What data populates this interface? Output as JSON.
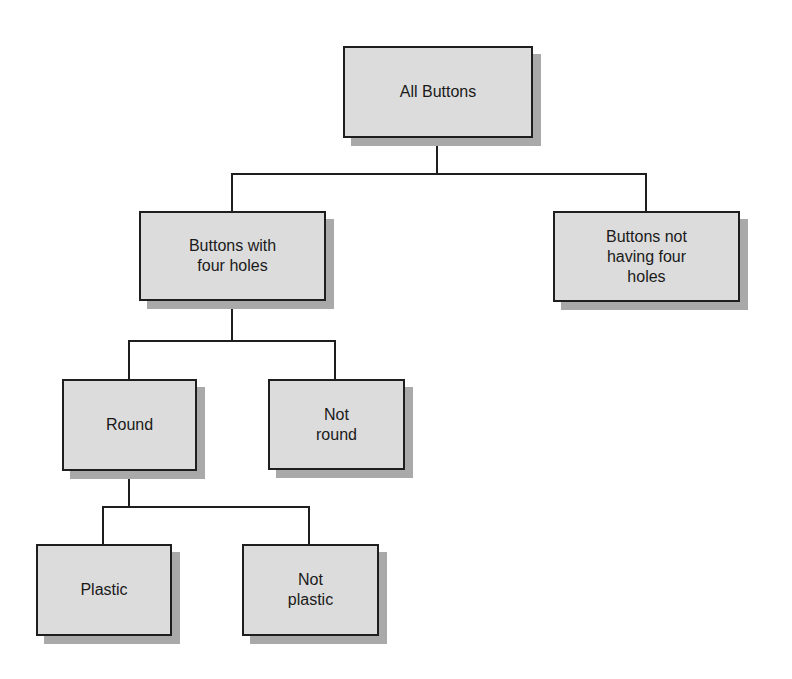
{
  "diagram": {
    "type": "tree",
    "nodes": {
      "root": {
        "label": "All Buttons"
      },
      "four_holes": {
        "label": "Buttons with\nfour holes"
      },
      "not_four_holes": {
        "label": "Buttons not\nhaving four\nholes"
      },
      "round": {
        "label": "Round"
      },
      "not_round": {
        "label": "Not\nround"
      },
      "plastic": {
        "label": "Plastic"
      },
      "not_plastic": {
        "label": "Not\nplastic"
      }
    },
    "edges": [
      [
        "All Buttons",
        "Buttons with four holes"
      ],
      [
        "All Buttons",
        "Buttons not having four holes"
      ],
      [
        "Buttons with four holes",
        "Round"
      ],
      [
        "Buttons with four holes",
        "Not round"
      ],
      [
        "Round",
        "Plastic"
      ],
      [
        "Round",
        "Not plastic"
      ]
    ]
  },
  "colors": {
    "node_fill": "#dcdcdc",
    "node_border": "#1e1e1e",
    "node_shadow": "#a9a9a9"
  }
}
